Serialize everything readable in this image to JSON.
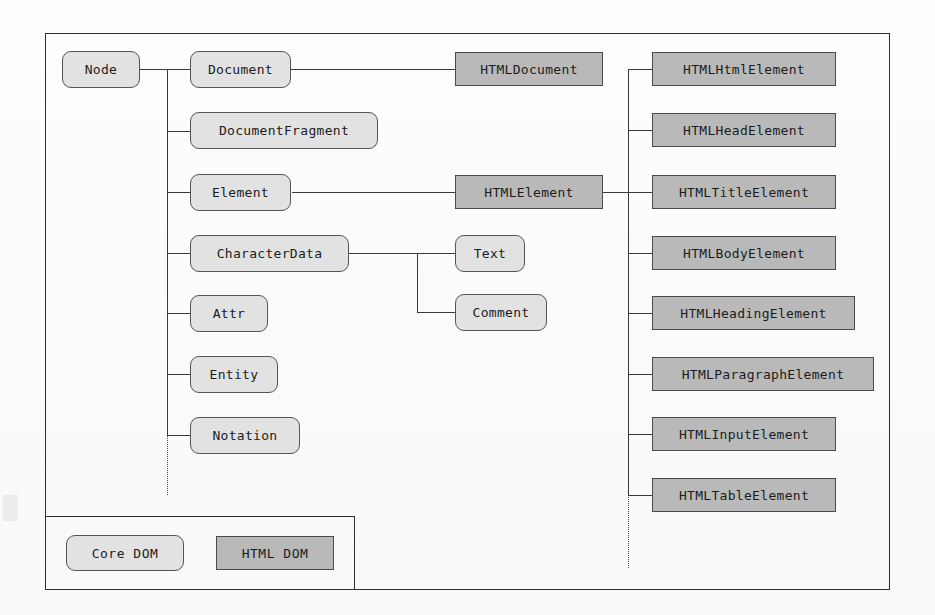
{
  "diagram": {
    "colors": {
      "core_dom_fill": "#e2e2e2",
      "html_dom_fill": "#b9b9b9",
      "line": "#3a3a3a",
      "frame": "#2e2e2e",
      "text": "#1c1c1c",
      "background": "#fdfdfc"
    },
    "root": {
      "label": "Node",
      "style": "core"
    },
    "core_nodes": [
      {
        "label": "Document",
        "style": "core"
      },
      {
        "label": "DocumentFragment",
        "style": "core"
      },
      {
        "label": "Element",
        "style": "core"
      },
      {
        "label": "CharacterData",
        "style": "core"
      },
      {
        "label": "Attr",
        "style": "core"
      },
      {
        "label": "Entity",
        "style": "core"
      },
      {
        "label": "Notation",
        "style": "core"
      }
    ],
    "character_data_children": [
      {
        "label": "Text",
        "style": "core"
      },
      {
        "label": "Comment",
        "style": "core"
      }
    ],
    "html_bridges": [
      {
        "label": "HTMLDocument",
        "style": "html",
        "parent": "Document"
      },
      {
        "label": "HTMLElement",
        "style": "html",
        "parent": "Element"
      }
    ],
    "html_elements": [
      {
        "label": "HTMLHtmlElement",
        "style": "html"
      },
      {
        "label": "HTMLHeadElement",
        "style": "html"
      },
      {
        "label": "HTMLTitleElement",
        "style": "html"
      },
      {
        "label": "HTMLBodyElement",
        "style": "html"
      },
      {
        "label": "HTMLHeadingElement",
        "style": "html"
      },
      {
        "label": "HTMLParagraphElement",
        "style": "html"
      },
      {
        "label": "HTMLInputElement",
        "style": "html"
      },
      {
        "label": "HTMLTableElement",
        "style": "html"
      }
    ],
    "continuation_marks": [
      {
        "name": "core-list-continues",
        "style": "dotted-vertical"
      },
      {
        "name": "html-list-continues",
        "style": "dotted-vertical"
      }
    ],
    "legend": {
      "items": [
        {
          "label": "Core DOM",
          "style": "core"
        },
        {
          "label": "HTML DOM",
          "style": "html"
        }
      ]
    }
  }
}
